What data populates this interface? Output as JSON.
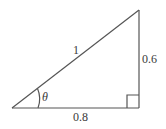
{
  "diagram": {
    "type": "right-triangle",
    "hypotenuse_label": "1",
    "opposite_label": "0.6",
    "adjacent_label": "0.8",
    "angle_label": "θ",
    "right_angle_marker": true,
    "stroke_color": "#555555"
  }
}
